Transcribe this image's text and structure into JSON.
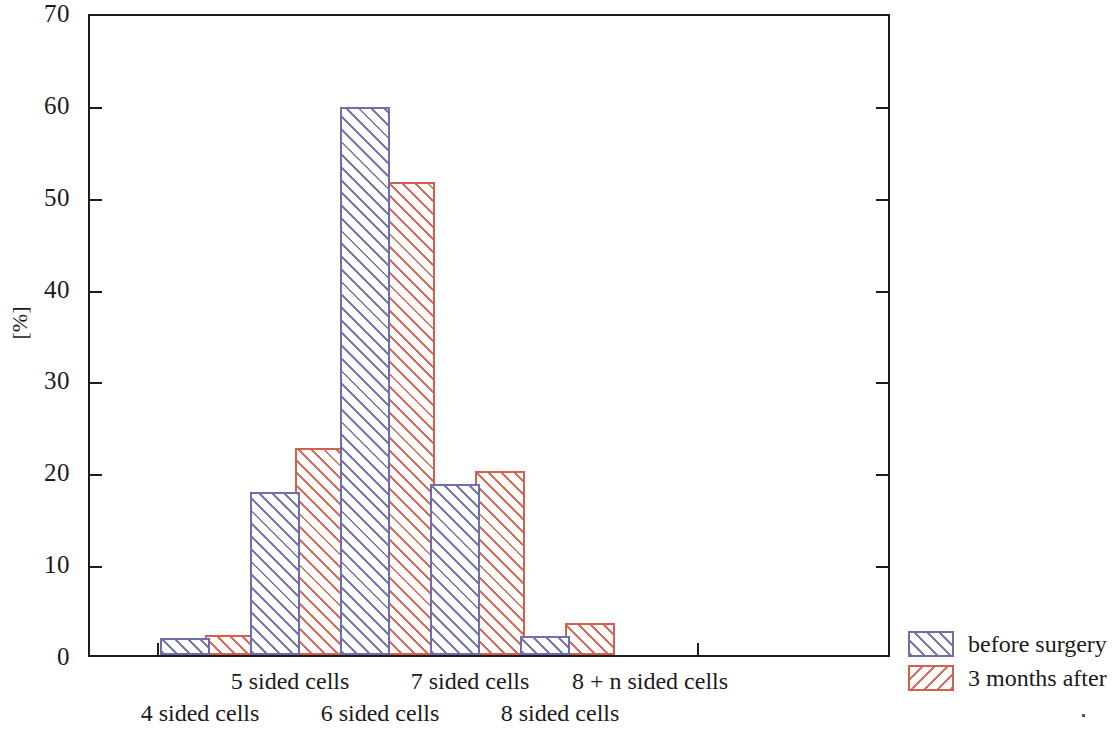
{
  "chart_data": {
    "type": "bar",
    "title": "",
    "subtitle": "",
    "xlabel": "",
    "ylabel": "[%]",
    "ylim": [
      0,
      70
    ],
    "yticks": [
      0,
      10,
      20,
      30,
      40,
      50,
      60,
      70
    ],
    "grid": false,
    "legend_position": "right-bottom",
    "categories": [
      "4 sided cells",
      "5 sided cells",
      "6 sided cells",
      "7 sided cells",
      "8 sided cells",
      "8 + n sided cells"
    ],
    "series": [
      {
        "name": "before surgery",
        "color": "#6e6ea8",
        "values": [
          1.8,
          17.8,
          59.7,
          18.6,
          2.1,
          0
        ]
      },
      {
        "name": "3 months after",
        "color": "#d2604f",
        "values": [
          2.2,
          22.5,
          51.5,
          20.0,
          3.5,
          0
        ]
      }
    ]
  },
  "axis": {
    "y_label": "[%]",
    "y_tick_labels": [
      "0",
      "10",
      "20",
      "30",
      "40",
      "50",
      "60",
      "70"
    ]
  },
  "legend": {
    "entries": [
      {
        "label": "before surgery"
      },
      {
        "label": "3 months after"
      }
    ]
  }
}
